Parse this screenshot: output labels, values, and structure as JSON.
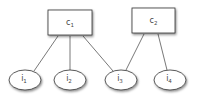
{
  "diagram": {
    "type": "bipartite-graph",
    "concepts": [
      {
        "id": "c1",
        "label": "c",
        "subscript": "1"
      },
      {
        "id": "c2",
        "label": "c",
        "subscript": "2"
      }
    ],
    "items": [
      {
        "id": "i1",
        "label": "i",
        "subscript": "1"
      },
      {
        "id": "i2",
        "label": "i",
        "subscript": "2"
      },
      {
        "id": "i3",
        "label": "i",
        "subscript": "3"
      },
      {
        "id": "i4",
        "label": "i",
        "subscript": "4"
      }
    ],
    "edges": [
      {
        "from": "c1",
        "to": "i1"
      },
      {
        "from": "c1",
        "to": "i2"
      },
      {
        "from": "c1",
        "to": "i3"
      },
      {
        "from": "c2",
        "to": "i3"
      },
      {
        "from": "c2",
        "to": "i4"
      }
    ]
  }
}
